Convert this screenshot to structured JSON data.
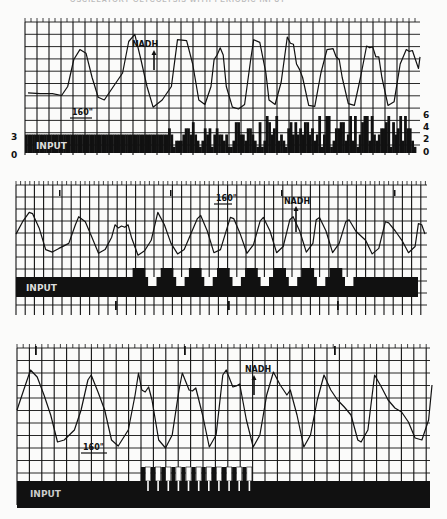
{
  "page_header": "OSCILLATORY GLYCOLYSIS WITH PERIODIC INPUT",
  "colors": {
    "ink": "#111111",
    "paper": "#fbfbfa",
    "grid": "#1a1a1a"
  },
  "chart_data": [
    {
      "type": "line",
      "panel": 1,
      "title": "",
      "trace_label": "NADH",
      "time_marker": "160\"",
      "input_label": "INPUT",
      "left_axis_ticks": [
        "3",
        "0"
      ],
      "right_axis_ticks": [
        "6",
        "4",
        "2",
        "0"
      ],
      "input_ylim": [
        0,
        6
      ],
      "trace_ylim": [
        0,
        10
      ],
      "trace": [
        [
          0,
          2.8
        ],
        [
          4,
          2.7
        ],
        [
          8,
          2.7
        ],
        [
          11,
          2.5
        ],
        [
          13,
          3.5
        ],
        [
          15,
          6.5
        ],
        [
          17,
          7.6
        ],
        [
          19,
          7.2
        ],
        [
          21,
          4.5
        ],
        [
          23,
          2.3
        ],
        [
          25,
          2.0
        ],
        [
          28,
          3.5
        ],
        [
          31,
          5.0
        ],
        [
          33,
          8.5
        ],
        [
          35,
          9.3
        ],
        [
          37,
          6.5
        ],
        [
          39,
          3.5
        ],
        [
          41,
          1.2
        ],
        [
          44,
          2.0
        ],
        [
          47,
          3.5
        ],
        [
          49,
          8.7
        ],
        [
          52,
          8.6
        ],
        [
          54,
          6.0
        ],
        [
          56,
          2.0
        ],
        [
          58,
          1.5
        ],
        [
          60,
          3.5
        ],
        [
          61,
          6.5
        ],
        [
          62,
          7.0
        ],
        [
          63,
          7.8
        ],
        [
          64,
          7.0
        ],
        [
          65,
          3.5
        ],
        [
          67,
          1.2
        ],
        [
          69,
          1.0
        ],
        [
          71,
          1.5
        ],
        [
          73,
          6.5
        ],
        [
          74,
          8.7
        ],
        [
          76,
          8.4
        ],
        [
          78,
          5.0
        ],
        [
          79,
          2.0
        ],
        [
          81,
          1.5
        ],
        [
          83,
          4.0
        ],
        [
          85,
          9.0
        ],
        [
          86,
          8.3
        ],
        [
          87,
          8.2
        ],
        [
          88,
          6.0
        ],
        [
          89,
          5.4
        ],
        [
          90,
          4.5
        ],
        [
          92,
          1.4
        ],
        [
          94,
          1.3
        ],
        [
          96,
          5.0
        ],
        [
          98,
          7.6
        ],
        [
          100,
          7.7
        ],
        [
          101,
          6.8
        ],
        [
          102,
          6.5
        ],
        [
          103,
          4.5
        ],
        [
          105,
          1.6
        ],
        [
          107,
          1.4
        ],
        [
          109,
          4.5
        ],
        [
          111,
          8.0
        ],
        [
          112,
          7.8
        ],
        [
          113,
          7.9
        ],
        [
          114,
          6.8
        ],
        [
          115,
          6.8
        ],
        [
          116,
          4.5
        ],
        [
          118,
          1.4
        ],
        [
          120,
          1.8
        ],
        [
          122,
          6.0
        ],
        [
          124,
          7.6
        ],
        [
          125,
          7.4
        ],
        [
          126,
          7.5
        ],
        [
          127,
          6.5
        ],
        [
          128,
          5.5
        ],
        [
          128.5,
          6.8
        ]
      ],
      "input_bars": [
        3,
        3,
        3,
        3,
        3,
        3,
        3,
        3,
        3,
        3,
        3,
        3,
        3,
        3,
        3,
        3,
        3,
        3,
        3,
        3,
        3,
        3,
        3,
        3,
        3,
        3,
        3,
        3,
        3,
        3,
        3,
        3,
        3,
        3,
        3,
        3,
        3,
        3,
        3,
        3,
        3,
        3,
        3,
        3,
        3,
        3,
        3,
        3,
        3,
        3,
        3,
        3,
        3,
        3,
        3,
        3,
        3,
        3,
        3,
        3,
        4,
        3,
        1,
        2,
        2,
        2,
        3,
        4,
        4,
        3,
        5,
        3,
        2,
        1,
        2,
        4,
        3,
        4,
        1,
        3,
        4,
        3,
        3,
        2,
        3,
        1,
        1,
        2,
        5,
        5,
        3,
        3,
        2,
        4,
        4,
        3,
        2,
        1,
        5,
        1,
        2,
        6,
        5,
        3,
        4,
        6,
        2,
        3,
        2,
        1,
        4,
        5,
        3,
        5,
        3,
        4,
        3,
        5,
        5,
        3,
        4,
        2,
        3,
        6,
        1,
        3,
        6,
        6,
        1,
        2,
        4,
        4,
        5,
        5,
        2,
        3,
        6,
        2,
        6,
        1,
        3,
        5,
        6,
        6,
        2,
        6,
        3,
        2,
        3,
        4,
        4,
        5,
        6,
        1,
        5,
        3,
        4,
        6,
        2,
        6,
        4,
        4,
        2,
        1
      ]
    },
    {
      "type": "line",
      "panel": 2,
      "title": "",
      "trace_label": "NADH",
      "time_marker": "160\"",
      "input_label": "INPUT",
      "trace_ylim": [
        0,
        10
      ],
      "trace": [
        [
          0,
          4.5
        ],
        [
          2,
          6.5
        ],
        [
          4,
          8.0
        ],
        [
          5,
          7.8
        ],
        [
          7,
          5.5
        ],
        [
          9,
          2.0
        ],
        [
          11,
          1.6
        ],
        [
          13,
          2.2
        ],
        [
          16,
          3.0
        ],
        [
          18,
          6.0
        ],
        [
          19,
          7.3
        ],
        [
          21,
          6.5
        ],
        [
          23,
          4.0
        ],
        [
          25,
          1.4
        ],
        [
          27,
          2.0
        ],
        [
          29,
          4.0
        ],
        [
          30,
          6.0
        ],
        [
          31,
          5.5
        ],
        [
          32,
          5.8
        ],
        [
          33,
          5.6
        ],
        [
          34,
          6.0
        ],
        [
          35,
          4.0
        ],
        [
          37,
          1.1
        ],
        [
          39,
          1.8
        ],
        [
          41,
          3.5
        ],
        [
          43,
          8.0
        ],
        [
          45,
          6.0
        ],
        [
          47,
          3.0
        ],
        [
          49,
          1.3
        ],
        [
          51,
          2.0
        ],
        [
          53,
          4.5
        ],
        [
          55,
          7.0
        ],
        [
          56,
          7.5
        ],
        [
          58,
          5.0
        ],
        [
          60,
          1.5
        ],
        [
          62,
          2.0
        ],
        [
          64,
          5.5
        ],
        [
          65,
          7.2
        ],
        [
          66,
          7.0
        ],
        [
          68,
          4.5
        ],
        [
          70,
          1.4
        ],
        [
          72,
          2.8
        ],
        [
          74,
          6.6
        ],
        [
          75,
          7.2
        ],
        [
          77,
          5.0
        ],
        [
          79,
          1.5
        ],
        [
          81,
          2.5
        ],
        [
          83,
          6.8
        ],
        [
          84,
          7.3
        ],
        [
          86,
          5.0
        ],
        [
          88,
          1.6
        ],
        [
          90,
          3.0
        ],
        [
          91,
          6.8
        ],
        [
          92,
          7.2
        ],
        [
          94,
          5.0
        ],
        [
          96,
          1.5
        ],
        [
          98,
          3.0
        ],
        [
          100,
          6.5
        ],
        [
          101,
          6.8
        ],
        [
          103,
          5.0
        ],
        [
          105,
          4.0
        ],
        [
          106,
          3.5
        ],
        [
          108,
          1.3
        ],
        [
          110,
          2.2
        ],
        [
          112,
          6.5
        ],
        [
          113,
          6.3
        ],
        [
          115,
          5.0
        ],
        [
          117,
          3.5
        ],
        [
          119,
          1.5
        ],
        [
          121,
          2.5
        ],
        [
          122,
          6.2
        ],
        [
          123,
          6.0
        ],
        [
          124,
          4.5
        ]
      ],
      "input_pulses": {
        "baseline": 0,
        "pulse_up": 1,
        "pulse_down": -1,
        "start_fraction": 0.29,
        "end_fraction": 0.85,
        "count": 8
      }
    },
    {
      "type": "line",
      "panel": 3,
      "title": "",
      "trace_label": "NADH",
      "time_marker": "160\"",
      "input_label": "INPUT",
      "trace_ylim": [
        0,
        10
      ],
      "trace": [
        [
          0,
          5.0
        ],
        [
          2,
          7.0
        ],
        [
          4,
          9.0
        ],
        [
          6,
          8.3
        ],
        [
          8,
          6.5
        ],
        [
          10,
          4.5
        ],
        [
          12,
          1.8
        ],
        [
          14,
          2.0
        ],
        [
          17,
          3.0
        ],
        [
          19,
          5.0
        ],
        [
          21,
          8.0
        ],
        [
          22,
          8.5
        ],
        [
          24,
          6.8
        ],
        [
          26,
          5.0
        ],
        [
          28,
          2.0
        ],
        [
          30,
          1.4
        ],
        [
          33,
          3.0
        ],
        [
          35,
          6.5
        ],
        [
          36,
          8.7
        ],
        [
          37,
          7.0
        ],
        [
          38,
          6.8
        ],
        [
          39,
          7.3
        ],
        [
          40,
          6.0
        ],
        [
          42,
          2.0
        ],
        [
          44,
          1.2
        ],
        [
          46,
          2.5
        ],
        [
          48,
          7.0
        ],
        [
          49,
          8.7
        ],
        [
          51,
          7.0
        ],
        [
          52,
          6.9
        ],
        [
          53,
          7.2
        ],
        [
          55,
          4.5
        ],
        [
          57,
          1.3
        ],
        [
          59,
          2.5
        ],
        [
          61,
          8.5
        ],
        [
          62,
          9.0
        ],
        [
          64,
          7.3
        ],
        [
          65,
          7.4
        ],
        [
          66,
          7.6
        ],
        [
          68,
          4.0
        ],
        [
          70,
          1.3
        ],
        [
          72,
          2.5
        ],
        [
          74,
          6.5
        ],
        [
          76,
          8.8
        ],
        [
          78,
          7.5
        ],
        [
          80,
          6.5
        ],
        [
          81,
          7.0
        ],
        [
          83,
          4.5
        ],
        [
          85,
          1.3
        ],
        [
          87,
          2.5
        ],
        [
          89,
          6.0
        ],
        [
          91,
          8.5
        ],
        [
          93,
          7.0
        ],
        [
          95,
          6.0
        ],
        [
          97,
          5.3
        ],
        [
          99,
          4.5
        ],
        [
          101,
          2.0
        ],
        [
          102,
          1.8
        ],
        [
          104,
          3.0
        ],
        [
          106,
          8.5
        ],
        [
          108,
          7.3
        ],
        [
          110,
          6.0
        ],
        [
          112,
          5.2
        ],
        [
          114,
          4.8
        ],
        [
          116,
          3.8
        ],
        [
          118,
          2.2
        ],
        [
          120,
          2.0
        ],
        [
          122,
          4.0
        ],
        [
          123,
          7.5
        ]
      ],
      "input_pulses": {
        "baseline": 0,
        "pulse_up": 1,
        "pulse_down": -1,
        "start_fraction": 0.3,
        "end_fraction": 0.57,
        "count": 11
      }
    }
  ]
}
